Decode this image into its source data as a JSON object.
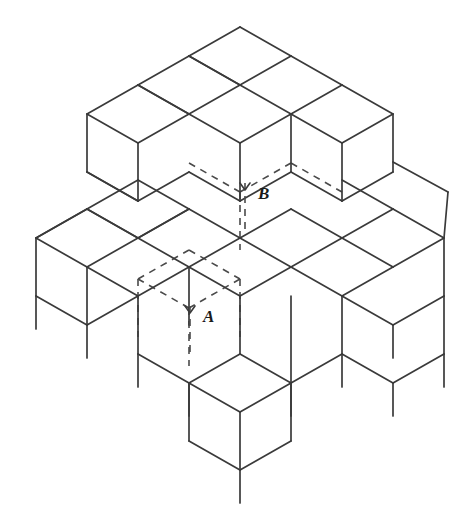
{
  "figure": {
    "type": "isometric-line-diagram",
    "background_color": "#ffffff",
    "line_color": "#3a3a3a",
    "hidden_line_color": "#4a4a4a",
    "label_color": "#1a1a1a",
    "canvas": {
      "width": 473,
      "height": 505
    }
  },
  "projection": {
    "origin_x": 240,
    "origin_y": 27,
    "dx": 51,
    "dy": 29,
    "cube_height": 58,
    "leg_length": 33,
    "description": "Standard isometric: +u goes right-down (51,29), +v goes left-down (-51,29), +w goes down (0,58)."
  },
  "callouts": [
    {
      "id": "callout-a",
      "label": "A",
      "label_x": 203,
      "label_y": 318,
      "head_x": 190,
      "head_y": 313,
      "line_top_y": 306,
      "line_bottom_y": 352,
      "description": "Arrow pointing to hidden cube A in the lower level"
    },
    {
      "id": "callout-b",
      "label": "B",
      "label_x": 258,
      "label_y": 195,
      "head_x": 245,
      "head_y": 190,
      "line_top_y": 183,
      "line_bottom_y": 229,
      "description": "Arrow pointing to hidden cube B in the upper level"
    }
  ],
  "hidden_cubes": [
    {
      "id": "cube-a",
      "label": "A",
      "grid_u": 1,
      "grid_v": 1,
      "level": 1,
      "visible": false
    },
    {
      "id": "cube-b",
      "label": "B",
      "grid_u": 1,
      "grid_v": 1,
      "level": 2,
      "visible": false
    }
  ],
  "structure": {
    "base_footprint": "3 by 3 grid of columns",
    "column_heights": [
      [
        2,
        2,
        2
      ],
      [
        2,
        3,
        2
      ],
      [
        2,
        2,
        2
      ]
    ],
    "lower_level_style": "wireframe with downward extended leg lines",
    "note": "Solid outlines show visible cube edges; dashed outlines show the concealed cubes A and B."
  },
  "accessibility": {
    "alt_text": "Line drawing of a stepped arrangement of identical cubes viewed isometrically. Dashed outlines reveal two hidden cubes, labelled A (lower) and B (upper), each indicated by a small upward arrow on a dashed leader line."
  }
}
